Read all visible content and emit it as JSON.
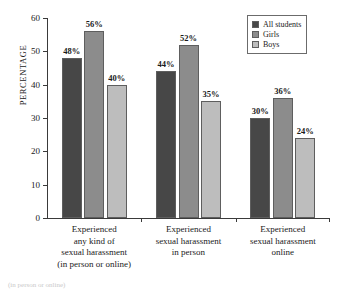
{
  "chart_data": {
    "type": "bar",
    "title": "",
    "xlabel": "",
    "ylabel": "PERCENTAGE",
    "ylim": [
      0,
      60
    ],
    "yticks": [
      0,
      10,
      20,
      30,
      40,
      50,
      60
    ],
    "grid": false,
    "legend_position": "top-right",
    "categories": [
      "Experienced\nany kind of\nsexual harassment\n(in person or online)",
      "Experienced\nsexual harassment\nin person",
      "Experienced\nsexual harassment\nonline"
    ],
    "series": [
      {
        "name": "All students",
        "color": "#474747",
        "values": [
          48,
          56,
          40
        ],
        "labels": [
          "48%",
          "44%",
          "30%"
        ]
      },
      {
        "name": "Girls",
        "color": "#8c8c8c",
        "values": [
          56,
          52,
          36
        ],
        "labels": [
          "56%",
          "52%",
          "36%"
        ]
      },
      {
        "name": "Boys",
        "color": "#bdbdbd",
        "values": [
          40,
          35,
          24
        ],
        "labels": [
          "40%",
          "35%",
          "24%"
        ]
      }
    ],
    "values_by_group": [
      [
        48,
        56,
        40
      ],
      [
        44,
        52,
        35
      ],
      [
        30,
        36,
        24
      ]
    ],
    "labels_by_group": [
      [
        "48%",
        "56%",
        "40%"
      ],
      [
        "44%",
        "52%",
        "35%"
      ],
      [
        "30%",
        "36%",
        "24%"
      ]
    ]
  },
  "legend": {
    "items": [
      {
        "label": "All students",
        "color": "#474747"
      },
      {
        "label": "Girls",
        "color": "#8c8c8c"
      },
      {
        "label": "Boys",
        "color": "#bdbdbd"
      }
    ]
  },
  "axis": {
    "y_title": "PERCENTAGE",
    "y_tick_labels": [
      "0",
      "10",
      "20",
      "30",
      "40",
      "50",
      "60"
    ]
  },
  "caption": "(in person or online)"
}
